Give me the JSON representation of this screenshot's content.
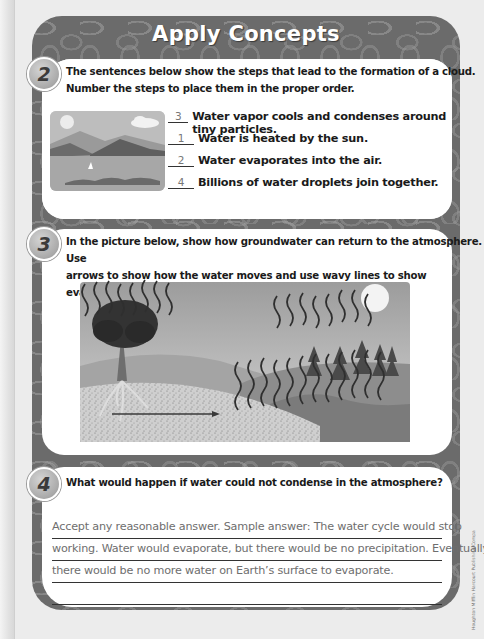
{
  "header": {
    "title": "Apply Concepts"
  },
  "questions": [
    {
      "number": "2",
      "prompt_line1": "The sentences below show the steps that lead to the formation of a cloud.",
      "prompt_line2": "Number the steps to place them in the proper order.",
      "image": "lake-with-mountains-sun-cloud-sailboat",
      "steps": [
        {
          "answer": "3",
          "text": "Water vapor cools and condenses around tiny particles."
        },
        {
          "answer": "1",
          "text": "Water is heated by the sun."
        },
        {
          "answer": "2",
          "text": "Water evaporates into the air."
        },
        {
          "answer": "4",
          "text": "Billions of water droplets join together."
        }
      ]
    },
    {
      "number": "3",
      "prompt_line1": "In the picture below, show how groundwater can return to the atmosphere. Use",
      "prompt_line2": "arrows to show how the water moves and use wavy lines to show evaporation.",
      "image": "landscape-tree-roots-groundwater-arrow-wavy-evaporation-lines"
    },
    {
      "number": "4",
      "prompt": "What would happen if water could not condense in the atmosphere?",
      "answer_lines": [
        "Accept any reasonable answer. Sample answer: The water cycle would stop",
        "working. Water would evaporate, but there would be no precipitation. Eventually",
        "there would be no more water on Earth’s surface to evaporate.",
        ""
      ]
    }
  ],
  "credit": "Houghton Mifflin Harcourt Publishing Company"
}
